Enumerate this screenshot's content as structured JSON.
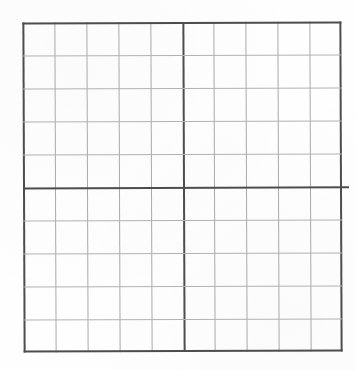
{
  "document": {
    "kind": "blank-grid-worksheet",
    "title": "",
    "caption": "",
    "background_color": "#fefefe"
  },
  "chart_data": {
    "type": "table",
    "title": "",
    "subtitle": "",
    "xlabel": "",
    "ylabel": "",
    "legend": [],
    "annotations": [],
    "grid": true,
    "columns": 10,
    "rows": 10,
    "major_column_every": 5,
    "major_row_every": 5,
    "cell_labels": [],
    "column_headers": [],
    "row_headers": [],
    "values": [],
    "x_tick_labels": [],
    "y_tick_labels": []
  },
  "grid": {
    "columns": 10,
    "rows": 10,
    "origin_x": 23,
    "origin_y": 22,
    "width": 319,
    "height": 330,
    "cell_width": 31.9,
    "cell_height": 33.0,
    "major_column_index": 5,
    "major_row_index": 5,
    "overshoot_px": 7,
    "minor_line_color_vertical": "#a9a9a9",
    "minor_line_color_horizontal": "#b2b2b2",
    "major_line_color": "#4d4d4d",
    "minor_line_width": 1,
    "major_line_width": 2
  }
}
